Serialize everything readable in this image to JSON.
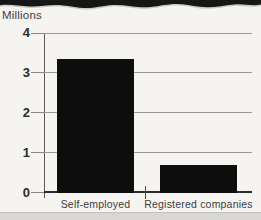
{
  "page": {
    "background_color": "#f5f4f1",
    "torn_edge_color": "#161616",
    "bottom_band_color": "#d9d7d3"
  },
  "chart_data": {
    "type": "bar",
    "title": "",
    "ylabel": "Millions",
    "xlabel": "",
    "categories": [
      "Self-employed",
      "Registered companies"
    ],
    "values": [
      3.35,
      0.7
    ],
    "yticks": [
      0,
      1,
      2,
      3,
      4
    ],
    "ylim": [
      0,
      4
    ],
    "grid": true,
    "legend": "none",
    "bar_color": "#0d0d0d",
    "gridline_color": "#9c9a96",
    "axis_color": "#2c2c2c"
  }
}
